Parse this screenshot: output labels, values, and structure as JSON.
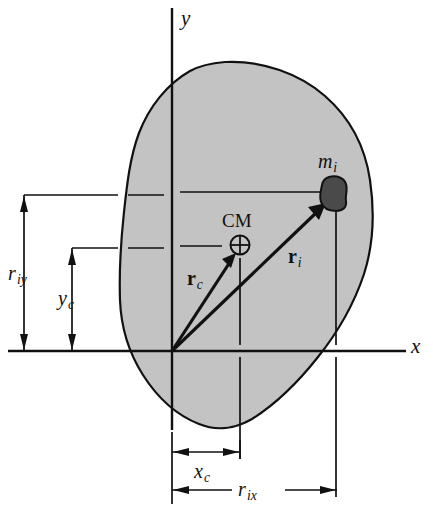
{
  "figure": {
    "background_color": "#ffffff",
    "body_fill_color": "#c3c3c3",
    "outline_color": "#111111",
    "particle_color": "#4a4a4a"
  },
  "axes": {
    "y_label": "y",
    "x_label": "x",
    "origin": {
      "x": 172,
      "y": 351
    }
  },
  "labels": {
    "center_of_mass": "CM",
    "particle_mass": {
      "base": "m",
      "sub": "i"
    },
    "vector_rc": {
      "base": "r",
      "sub": "c"
    },
    "vector_ri": {
      "base": "r",
      "sub": "i"
    }
  },
  "dimensions": [
    {
      "name": "r_iy",
      "base": "r",
      "sub": "iy",
      "orientation": "vertical",
      "from": 195,
      "to": 351,
      "at": 24
    },
    {
      "name": "y_c",
      "base": "y",
      "sub": "c",
      "orientation": "vertical",
      "from": 248,
      "to": 351,
      "at": 72
    },
    {
      "name": "x_c",
      "base": "x",
      "sub": "c",
      "orientation": "horizontal",
      "from": 172,
      "to": 240,
      "at": 452
    },
    {
      "name": "r_ix",
      "base": "r",
      "sub": "ix",
      "orientation": "horizontal",
      "from": 172,
      "to": 337,
      "at": 490
    }
  ],
  "points": {
    "cm": {
      "x": 240,
      "y": 245,
      "marker": "circle-plus"
    },
    "mass_particle": {
      "x": 333,
      "y": 192
    }
  }
}
